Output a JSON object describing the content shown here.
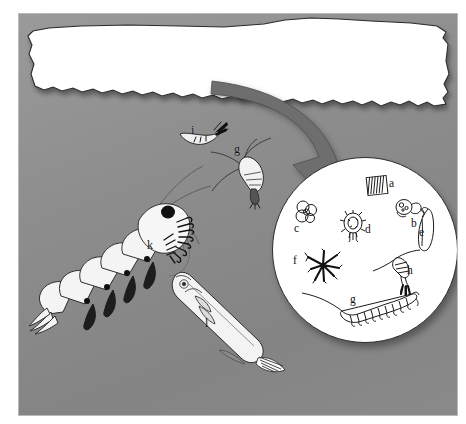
{
  "figure": {
    "background_color": "#8d8d8d",
    "ice_color": "#ffffff",
    "arrow_color": "#6e6e6e",
    "ink_color": "#1b1b1b",
    "frame_color": "#b9b9b9"
  },
  "ice": {
    "name": "sea-ice floe",
    "underside_texture": "jagged"
  },
  "arrow": {
    "name": "magnification arrow",
    "from": "sea-ice underside",
    "to": "magnified circle inset"
  },
  "magnified_circle": {
    "name": "ice-algae and microfauna inset",
    "items": [
      {
        "key": "a",
        "label": "a",
        "organism": "diatom chain (pennate diatoms)",
        "x": 117,
        "y": 23
      },
      {
        "key": "b",
        "label": "b",
        "organism": "ciliate / flagellate",
        "x": 139,
        "y": 63
      },
      {
        "key": "c",
        "label": "c",
        "organism": "colonial algae cluster",
        "x": 22,
        "y": 68
      },
      {
        "key": "d",
        "label": "d",
        "organism": "radiolarian / heliozoan",
        "x": 93,
        "y": 69
      },
      {
        "key": "e",
        "label": "e",
        "organism": "curved diatom (Corethron-like)",
        "x": 147,
        "y": 72
      },
      {
        "key": "f",
        "label": "f",
        "organism": "stellate diatom colony (Chaetoceros)",
        "x": 21,
        "y": 100
      },
      {
        "key": "g",
        "label": "g",
        "organism": "harpacticoid copepod",
        "x": 78,
        "y": 139
      },
      {
        "key": "h",
        "label": "h",
        "organism": "copepod nauplius / calanoid",
        "x": 135,
        "y": 110
      }
    ]
  },
  "water_column": {
    "name": "under-ice water column",
    "items": [
      {
        "key": "i",
        "label": "i",
        "organism": "amphipod near ice underside",
        "x": 172,
        "y": 111
      },
      {
        "key": "g",
        "label": "g",
        "organism": "calanoid copepod",
        "x": 215,
        "y": 131
      },
      {
        "key": "k",
        "label": "k",
        "organism": "Antarctic krill (Euphausia superba)",
        "x": 128,
        "y": 228
      },
      {
        "key": "l",
        "label": "l",
        "organism": "Antarctic silverfish (juvenile fish)",
        "x": 186,
        "y": 305
      }
    ]
  },
  "legend_keys": [
    "a",
    "b",
    "c",
    "d",
    "e",
    "f",
    "g",
    "h",
    "i",
    "k",
    "l"
  ]
}
